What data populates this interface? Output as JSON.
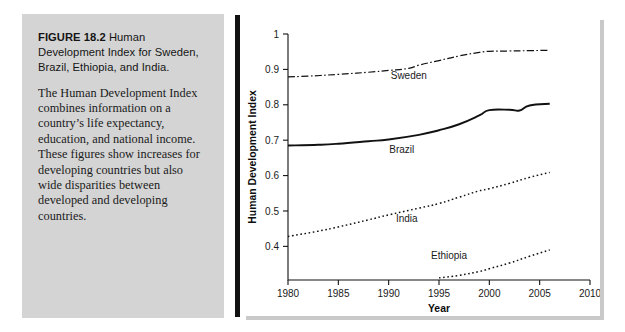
{
  "figure": {
    "caption_label": "FIGURE 18.2",
    "caption_title": "Human Development Index for Sweden, Brazil, Ethiopia, and India.",
    "caption_body": "The Human Development Index combines information on a country’s life expectancy, education, and national income. These figures show increases for developing countries but also wide disparities between developed and developing countries."
  },
  "chart_data": {
    "type": "line",
    "title": "",
    "xlabel": "Year",
    "ylabel": "Human Development Index",
    "xlim": [
      1980,
      2010
    ],
    "ylim": [
      0.305,
      1.0
    ],
    "xticks": [
      1980,
      1985,
      1990,
      1995,
      2000,
      2005,
      2010
    ],
    "xticklabels": [
      "1980",
      "1985",
      "1990",
      "1995",
      "2000",
      "2005",
      "2010"
    ],
    "yticks": [
      0.4,
      0.5,
      0.6,
      0.7,
      0.8,
      0.9,
      1.0
    ],
    "yticklabels": [
      "0.4",
      "0.5",
      "0.6",
      "0.7",
      "0.8",
      "0.9",
      "1"
    ],
    "grid": false,
    "legend": "inline-labels",
    "series": [
      {
        "name": "Sweden",
        "linestyle": "dashdot",
        "color": "#111111",
        "label_x": 1992.0,
        "label_y": 0.872,
        "x": [
          1980,
          1982,
          1985,
          1988,
          1990,
          1992,
          1993,
          1995,
          1997,
          1999,
          2000,
          2002,
          2004,
          2006
        ],
        "y": [
          0.879,
          0.881,
          0.886,
          0.892,
          0.897,
          0.903,
          0.912,
          0.925,
          0.938,
          0.948,
          0.951,
          0.952,
          0.953,
          0.954
        ]
      },
      {
        "name": "Brazil",
        "linestyle": "solid",
        "color": "#111111",
        "label_x": 1991.3,
        "label_y": 0.664,
        "x": [
          1980,
          1983,
          1985,
          1988,
          1990,
          1993,
          1995,
          1997,
          1999,
          2000,
          2002,
          2003,
          2004,
          2006
        ],
        "y": [
          0.685,
          0.687,
          0.69,
          0.697,
          0.702,
          0.715,
          0.728,
          0.745,
          0.77,
          0.785,
          0.786,
          0.784,
          0.798,
          0.803
        ]
      },
      {
        "name": "India",
        "linestyle": "dotted",
        "color": "#111111",
        "label_x": 1991.8,
        "label_y": 0.47,
        "x": [
          1980,
          1983,
          1985,
          1988,
          1990,
          1993,
          1995,
          1997,
          1999,
          2000,
          2002,
          2004,
          2006
        ],
        "y": [
          0.428,
          0.443,
          0.455,
          0.475,
          0.489,
          0.508,
          0.521,
          0.539,
          0.557,
          0.563,
          0.578,
          0.595,
          0.609
        ]
      },
      {
        "name": "Ethiopia",
        "linestyle": "dotted",
        "color": "#111111",
        "label_x": 1996.0,
        "label_y": 0.365,
        "x": [
          1995,
          1997,
          1999,
          2000,
          2002,
          2004,
          2006
        ],
        "y": [
          0.311,
          0.318,
          0.329,
          0.337,
          0.353,
          0.372,
          0.39
        ]
      }
    ]
  }
}
